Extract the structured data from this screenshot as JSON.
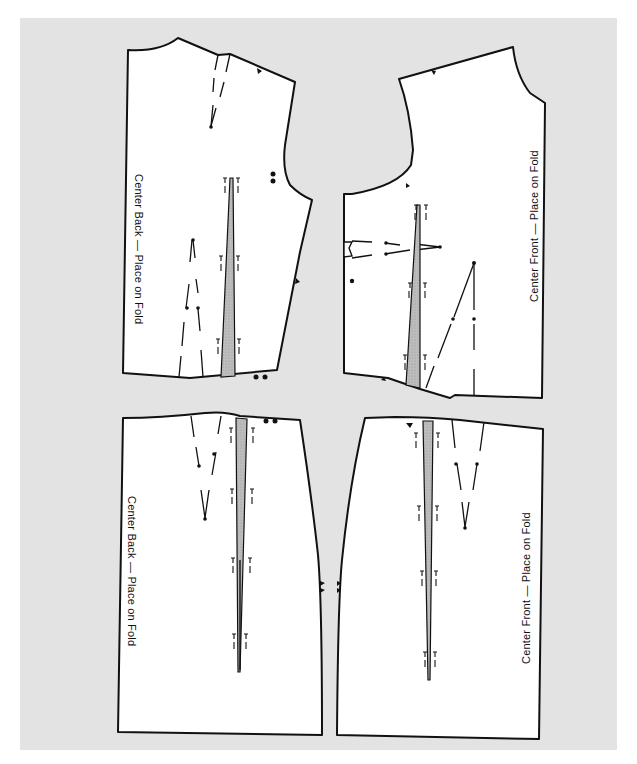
{
  "diagram": {
    "type": "sewing-pattern-layout",
    "background_color": "#e3e3e3",
    "piece_fill": "#ffffff",
    "outline_color": "#111111",
    "dart_shading": "#b8b8b8",
    "pieces": [
      {
        "id": "bodice-back",
        "label": "Center Back — Place on Fold"
      },
      {
        "id": "bodice-front",
        "label": "Center Front — Place on Fold"
      },
      {
        "id": "skirt-back",
        "label": "Center Back — Place on Fold"
      },
      {
        "id": "skirt-front",
        "label": "Center Front — Place on Fold"
      }
    ]
  }
}
